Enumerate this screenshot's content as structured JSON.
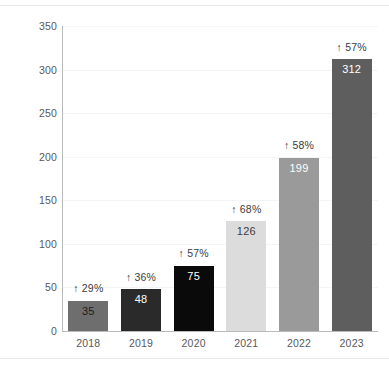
{
  "chart_data": {
    "type": "bar",
    "title": "",
    "subtitle": "",
    "xlabel": "",
    "ylabel": "",
    "categories": [
      "2018",
      "2019",
      "2020",
      "2021",
      "2022",
      "2023"
    ],
    "values": [
      35,
      48,
      75,
      126,
      199,
      312
    ],
    "value_labels": [
      "35",
      "48",
      "75",
      "126",
      "199",
      "312"
    ],
    "annotations": [
      "↑ 29%",
      "↑ 36%",
      "↑ 57%",
      "↑ 68%",
      "↑ 58%",
      "↑ 57%"
    ],
    "ylim": [
      0,
      350
    ],
    "yticks": [
      0,
      50,
      100,
      150,
      200,
      250,
      300,
      350
    ],
    "ytick_labels": [
      "0",
      "50",
      "100",
      "150",
      "200",
      "250",
      "300",
      "350"
    ],
    "grid": true,
    "legend": false,
    "bar_colors": [
      "#6e6e6e",
      "#2a2a2a",
      "#0a0a0a",
      "#dcdcdc",
      "#9a9a9a",
      "#5e5e5e"
    ],
    "value_label_colors": [
      "#1c1c1c",
      "#ffffff",
      "#ffffff",
      "#3c3c3e",
      "#ffffff",
      "#ffffff"
    ]
  },
  "style": {
    "background": "#ffffff",
    "axis_color": "#b9babc",
    "grid_color": "#f3f4f5",
    "tick_text_color": "#59595b",
    "annotation_color": "#3c3c3e"
  }
}
